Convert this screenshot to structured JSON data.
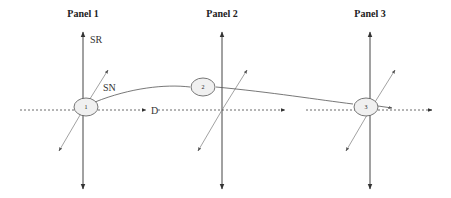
{
  "panels": [
    {
      "title": "Panel 1",
      "cx": 83,
      "title_x": 83
    },
    {
      "title": "Panel 2",
      "cx": 222,
      "title_x": 222
    },
    {
      "title": "Panel 3",
      "cx": 370,
      "title_x": 370
    }
  ],
  "axis_labels": {
    "sr": "SR",
    "sn": "SN",
    "d": "D"
  },
  "nodes": [
    {
      "label": "1",
      "x": 86,
      "y": 107
    },
    {
      "label": "2",
      "x": 203,
      "y": 87
    },
    {
      "label": "3",
      "x": 366,
      "y": 107
    }
  ],
  "colors": {
    "axis": "#444444",
    "diagonal": "#8a8a8a",
    "node_fill": "#f0f0f0",
    "node_stroke": "#555555"
  }
}
